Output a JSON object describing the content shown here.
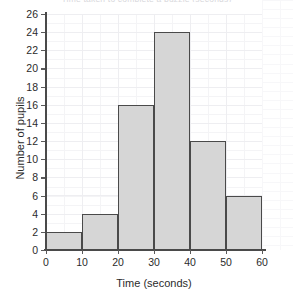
{
  "figure": {
    "title_remnant": "Time taken to complete a puzzle (seconds)",
    "x_axis_title": "Time (seconds)",
    "y_axis_title": "Number of pupils",
    "bar_fill_color": "#d6d6d6",
    "bar_edge_color": "#4a4a4a",
    "axis_color": "#4a4a4a",
    "grid_color": "#eeeef1",
    "background_color": "#ffffff"
  },
  "chart_data": {
    "type": "bar",
    "title": "",
    "xlabel": "Time (seconds)",
    "ylabel": "Number of pupils",
    "xlim": [
      0,
      60
    ],
    "ylim": [
      0,
      26
    ],
    "grid": true,
    "legend": "none",
    "bin_width": 10,
    "bin_edges": [
      0,
      10,
      20,
      30,
      40,
      50,
      60
    ],
    "categories": [
      "0-10",
      "10-20",
      "20-30",
      "30-40",
      "40-50",
      "50-60"
    ],
    "values": [
      2,
      4,
      16,
      24,
      12,
      6
    ],
    "x_ticks": [
      "0",
      "10",
      "20",
      "30",
      "40",
      "50",
      "60"
    ],
    "x_tick_values": [
      0,
      10,
      20,
      30,
      40,
      50,
      60
    ],
    "y_ticks": [
      "0",
      "2",
      "4",
      "6",
      "8",
      "10",
      "12",
      "14",
      "16",
      "18",
      "20",
      "22",
      "24",
      "26"
    ],
    "y_tick_values": [
      0,
      2,
      4,
      6,
      8,
      10,
      12,
      14,
      16,
      18,
      20,
      22,
      24,
      26
    ]
  }
}
